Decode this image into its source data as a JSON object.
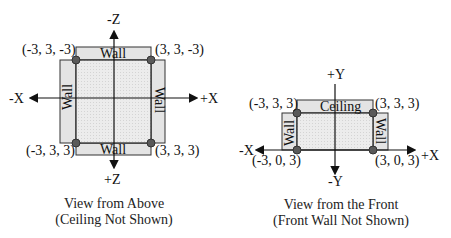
{
  "top_view": {
    "axes": {
      "neg_z": "-Z",
      "pos_z": "+Z",
      "neg_x": "-X",
      "pos_x": "+X"
    },
    "corners": {
      "top_left": "(-3, 3, -3)",
      "top_right": "(3, 3, -3)",
      "bottom_left": "(-3, 3, 3)",
      "bottom_right": "(3, 3, 3)"
    },
    "walls": {
      "top": "Wall",
      "bottom": "Wall",
      "left": "Wall",
      "right": "Wall"
    },
    "caption_line1": "View from Above",
    "caption_line2": "(Ceiling Not Shown)"
  },
  "front_view": {
    "axes": {
      "pos_y": "+Y",
      "neg_y": "-Y",
      "neg_x": "-X",
      "pos_x": "+X"
    },
    "corners": {
      "top_left": "(-3, 3, 3)",
      "top_right": "(3, 3, 3)",
      "bottom_left": "(-3, 0, 3)",
      "bottom_right": "(3, 0, 3)"
    },
    "panels": {
      "ceiling": "Ceiling",
      "left": "Wall",
      "right": "Wall"
    },
    "caption_line1": "View from the Front",
    "caption_line2": "(Front Wall Not Shown)"
  },
  "colors": {
    "panel": "#e6e6e6",
    "floor": "#ededed",
    "dot": "#5a5a5a",
    "line": "#222222"
  }
}
